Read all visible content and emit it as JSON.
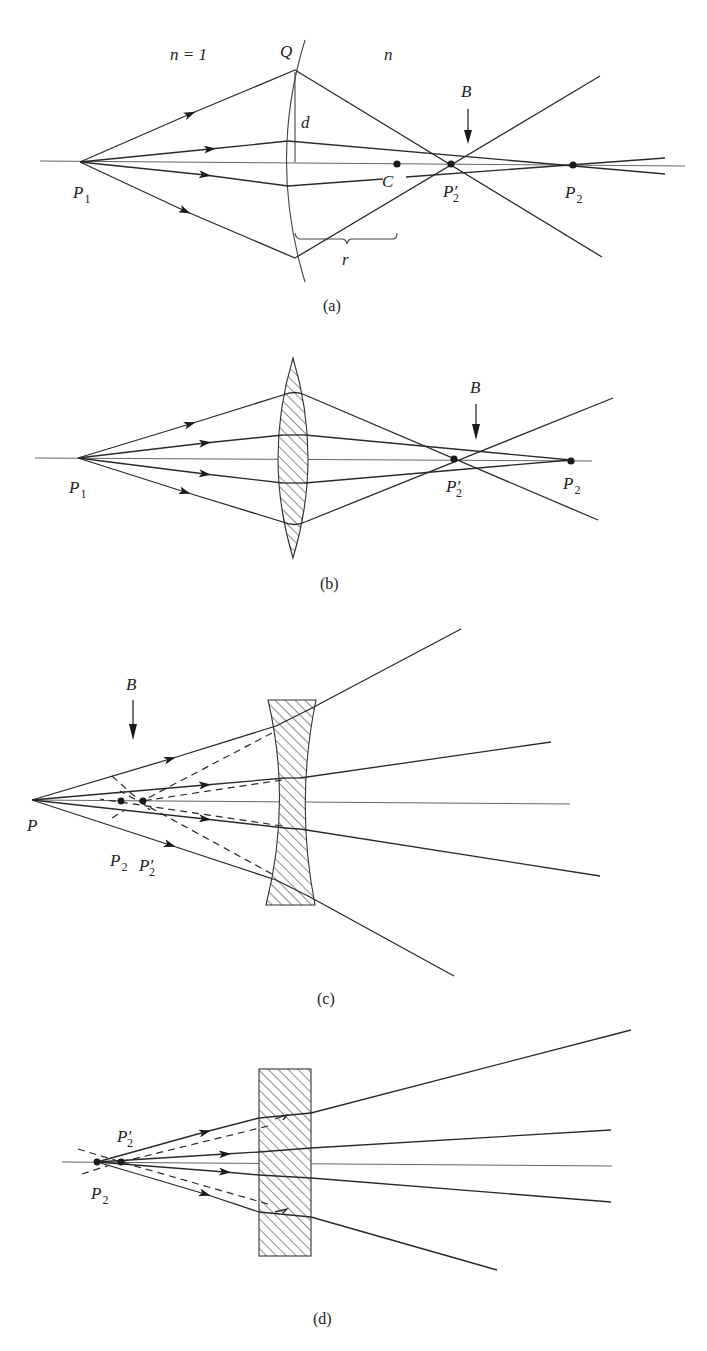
{
  "figure": {
    "panels": [
      {
        "id": "a",
        "caption": "(a)",
        "description": "Refraction at a single spherical surface of radius r separating n = 1 from n",
        "labels": {
          "medium_left": "n = 1",
          "medium_right": "n",
          "surface_point": "Q",
          "height": "d",
          "center": "C",
          "radius": "r",
          "object": "P",
          "object_sub": "1",
          "paraxial_image": "P",
          "paraxial_image_sub": "2",
          "marginal_image": "P′",
          "marginal_image_sub": "2",
          "best_focus": "B"
        }
      },
      {
        "id": "b",
        "caption": "(b)",
        "description": "Converging (biconvex) lens showing spherical aberration",
        "labels": {
          "object": "P",
          "object_sub": "1",
          "paraxial_image": "P",
          "paraxial_image_sub": "2",
          "marginal_image": "P′",
          "marginal_image_sub": "2",
          "best_focus": "B"
        }
      },
      {
        "id": "c",
        "caption": "(c)",
        "description": "Diverging (biconcave) lens with virtual images",
        "labels": {
          "object": "P",
          "paraxial_image": "P",
          "paraxial_image_sub": "2",
          "marginal_image": "P′",
          "marginal_image_sub": "2",
          "best_focus": "B"
        }
      },
      {
        "id": "d",
        "caption": "(d)",
        "description": "Plane-parallel slab producing virtual images",
        "labels": {
          "paraxial_image": "P",
          "paraxial_image_sub": "2",
          "marginal_image": "P′",
          "marginal_image_sub": "2"
        }
      }
    ]
  }
}
